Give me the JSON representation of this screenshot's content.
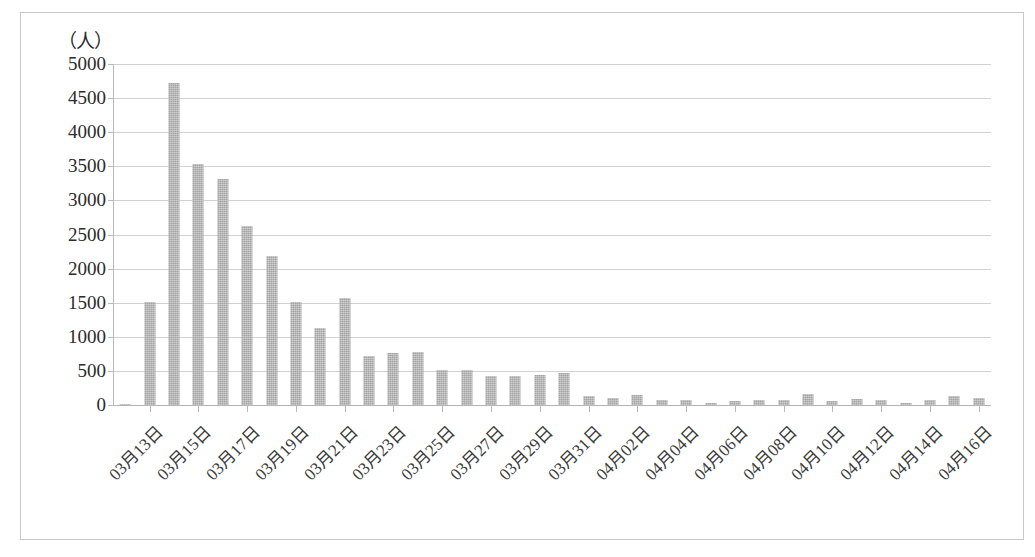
{
  "chart": {
    "type": "bar",
    "unit_caption": "（人）",
    "y_axis_unit": "人"
  },
  "chart_data": {
    "type": "bar",
    "title": "",
    "subtitle": "",
    "xlabel": "",
    "ylabel": "（人）",
    "ylim": [
      0,
      5000
    ],
    "ytick_values": [
      0,
      500,
      1000,
      1500,
      2000,
      2500,
      3000,
      3500,
      4000,
      4500,
      5000
    ],
    "ytick_labels": [
      "0",
      "500",
      "1000",
      "1500",
      "2000",
      "2500",
      "3000",
      "3500",
      "4000",
      "4500",
      "5000"
    ],
    "grid": true,
    "legend": null,
    "bar_color": "#a3a3a3",
    "categories": [
      "03月12日",
      "03月13日",
      "03月14日",
      "03月15日",
      "03月16日",
      "03月17日",
      "03月18日",
      "03月19日",
      "03月20日",
      "03月21日",
      "03月22日",
      "03月23日",
      "03月24日",
      "03月25日",
      "03月26日",
      "03月27日",
      "03月28日",
      "03月29日",
      "03月30日",
      "03月31日",
      "04月01日",
      "04月02日",
      "04月03日",
      "04月04日",
      "04月05日",
      "04月06日",
      "04月07日",
      "04月08日",
      "04月09日",
      "04月10日",
      "04月11日",
      "04月12日",
      "04月13日",
      "04月14日",
      "04月15日",
      "04月16日"
    ],
    "values": [
      20,
      1510,
      4720,
      3530,
      3310,
      2630,
      2190,
      1510,
      1130,
      1570,
      720,
      760,
      780,
      520,
      520,
      430,
      420,
      440,
      470,
      130,
      110,
      140,
      80,
      70,
      30,
      60,
      70,
      80,
      160,
      60,
      90,
      70,
      30,
      80,
      130,
      100
    ],
    "xtick_labels": [
      "03月13日",
      "03月15日",
      "03月17日",
      "03月19日",
      "03月21日",
      "03月23日",
      "03月25日",
      "03月27日",
      "03月29日",
      "03月31日",
      "04月02日",
      "04月04日",
      "04月06日",
      "04月08日",
      "04月10日",
      "04月12日",
      "04月14日",
      "04月16日"
    ],
    "xtick_indices": [
      1,
      3,
      5,
      7,
      9,
      11,
      13,
      15,
      17,
      19,
      21,
      23,
      25,
      27,
      29,
      31,
      33,
      35
    ]
  }
}
